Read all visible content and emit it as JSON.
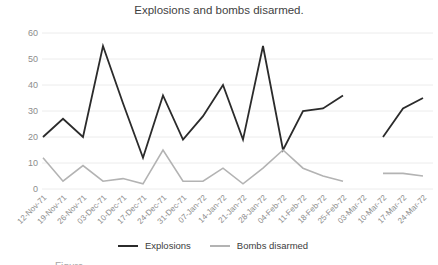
{
  "chart": {
    "title": "Explosions and bombs disarmed."
  },
  "caption_fragment": "Figure",
  "chart_data": {
    "type": "line",
    "title": "Explosions and bombs disarmed.",
    "categories": [
      "12-Nov-71",
      "19-Nov-71",
      "26-Nov-71",
      "03-Dec-71",
      "10-Dec-71",
      "17-Dec-71",
      "24-Dec-71",
      "31-Dec-71",
      "07-Jan-72",
      "14-Jan-72",
      "21-Jan-72",
      "28-Jan-72",
      "04-Feb-72",
      "11-Feb-72",
      "18-Feb-72",
      "25-Feb-72",
      "03-Mar-72",
      "10-Mar-72",
      "17-Mar-72",
      "24-Mar-72"
    ],
    "series": [
      {
        "name": "Explosions",
        "color": "#2b2b2b",
        "width": 1.8,
        "values": [
          20,
          27,
          20,
          55,
          33,
          12,
          36,
          19,
          28,
          40,
          19,
          55,
          15,
          30,
          31,
          36,
          null,
          20,
          31,
          35
        ]
      },
      {
        "name": "Bombs disarmed",
        "color": "#b3b3b3",
        "width": 1.6,
        "values": [
          12,
          3,
          9,
          3,
          4,
          2,
          15,
          3,
          3,
          8,
          2,
          8,
          15,
          8,
          5,
          3,
          null,
          6,
          6,
          5
        ]
      }
    ],
    "missing_categories": [
      "03-Mar-72"
    ],
    "xlabel": "",
    "ylabel": "",
    "ylim": [
      0,
      60
    ],
    "yticks": [
      0,
      10,
      20,
      30,
      40,
      50,
      60
    ],
    "grid": true,
    "gridline_color": "#ececec",
    "tick_label_color": "#8c8c8c",
    "legend_position": "bottom"
  }
}
